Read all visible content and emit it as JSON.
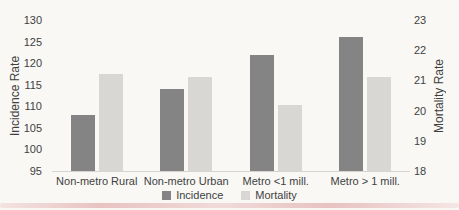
{
  "chart_data": {
    "type": "bar",
    "title": "",
    "categories": [
      "Non-metro Rural",
      "Non-metro Urban",
      "Metro <1 mill.",
      "Metro > 1 mill."
    ],
    "series": [
      {
        "name": "Incidence",
        "axis": "left",
        "color": "#848484",
        "values": [
          108,
          114,
          122,
          126
        ]
      },
      {
        "name": "Mortality",
        "axis": "right",
        "color": "#d8d7d4",
        "values": [
          21.2,
          21.1,
          20.2,
          21.1
        ]
      }
    ],
    "left_axis": {
      "label": "Incidence Rate",
      "min": 95,
      "max": 130,
      "ticks": [
        130,
        125,
        120,
        115,
        110,
        105,
        100,
        95
      ]
    },
    "right_axis": {
      "label": "Mortality Rate",
      "min": 18,
      "max": 23,
      "ticks": [
        23,
        22,
        21,
        20,
        19,
        18
      ]
    },
    "legend_position": "bottom",
    "grid": false
  },
  "colors": {
    "background": "#f9f8f5",
    "text": "#3f3f3f",
    "baseline": "#d6d4d0",
    "incidence_bar": "#848484",
    "mortality_bar": "#d8d7d4",
    "scan_artifact": "#dda2a2"
  }
}
